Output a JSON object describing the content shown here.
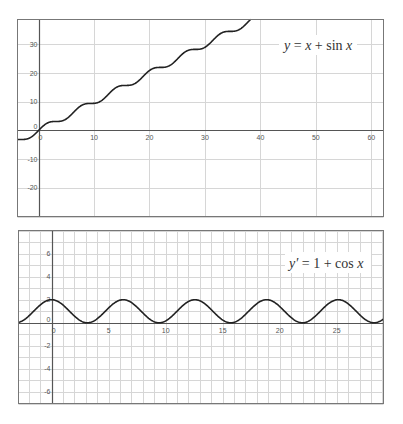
{
  "chart_data": [
    {
      "type": "line",
      "title": "y = x + sin x",
      "label": {
        "prefix": "y",
        "eq": " = ",
        "x1": "x",
        "plus": " + sin ",
        "x2": "x"
      },
      "xlabel": "",
      "ylabel": "",
      "xlim": [
        -3.8,
        62.2
      ],
      "ylim": [
        -30,
        38.7
      ],
      "xticks": [
        0,
        10,
        20,
        30,
        40,
        50,
        60
      ],
      "yticks": [
        -20,
        -10,
        0,
        10,
        20,
        30
      ],
      "grid": true,
      "series": [
        {
          "name": "y = x + sin x",
          "function": "x + sin(x)",
          "x_range": [
            -3.8,
            38.3
          ],
          "color": "#222222"
        }
      ],
      "sample_points": {
        "x": [
          -3.8,
          0,
          5,
          10,
          15,
          20,
          25,
          30,
          35,
          38.3
        ],
        "y": [
          -3.19,
          0,
          4.04,
          9.46,
          15.65,
          20.91,
          24.87,
          29.01,
          34.57,
          38.92
        ]
      }
    },
    {
      "type": "line",
      "title": "y' = 1 + cos x",
      "label": {
        "prefix": "y′",
        "eq": " = 1 + cos ",
        "x1": "x"
      },
      "xlabel": "",
      "ylabel": "",
      "xlim": [
        -2.9,
        29.1
      ],
      "ylim": [
        -7,
        8
      ],
      "xticks": [
        0,
        5,
        10,
        15,
        20,
        25
      ],
      "yticks": [
        -6,
        -4,
        -2,
        0,
        2,
        4,
        6
      ],
      "grid": true,
      "grid_step": 1,
      "series": [
        {
          "name": "y' = 1 + cos x",
          "function": "1 + cos(x)",
          "x_range": [
            -2.9,
            29.1
          ],
          "color": "#222222"
        }
      ],
      "sample_points": {
        "x": [
          0,
          3.14,
          6.28,
          9.42,
          12.57,
          15.71,
          18.85,
          21.99,
          25.13,
          28.27
        ],
        "y": [
          2,
          0,
          2,
          0,
          2,
          0,
          2,
          0,
          2,
          0
        ]
      }
    }
  ],
  "colors": {
    "frame": "#777777",
    "grid": "#d6d6d6",
    "axis": "#555555",
    "curve": "#222222"
  }
}
